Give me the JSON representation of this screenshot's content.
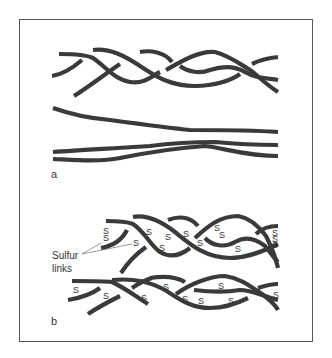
{
  "figure": {
    "panel_a_label": "a",
    "panel_b_label": "b",
    "annotation": {
      "line1": "Sulfur",
      "line2": "links"
    },
    "sulfur_symbol": "S",
    "colors": {
      "strand": "#3a3a3a",
      "frame": "#555555",
      "background": "#ffffff"
    }
  }
}
